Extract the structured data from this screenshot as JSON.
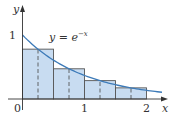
{
  "chart_data": {
    "type": "area",
    "title": "",
    "curve_label": "y = e^(−x)",
    "curve_label_parts": {
      "lhs": "y",
      "eq": " = ",
      "base": "e",
      "exp": "−x"
    },
    "xlabel": "x",
    "ylabel": "y",
    "x_ticks": [
      {
        "value": 0,
        "label": "0"
      },
      {
        "value": 1,
        "label": "1"
      },
      {
        "value": 2,
        "label": "2"
      }
    ],
    "y_ticks": [
      {
        "value": 1,
        "label": "1"
      }
    ],
    "xlim": [
      0,
      2.3
    ],
    "ylim": [
      0,
      1.5
    ],
    "method": "midpoint rule",
    "n": 4,
    "rectangles": [
      {
        "x0": 0.0,
        "x1": 0.5,
        "midpoint": 0.25,
        "height": 0.779
      },
      {
        "x0": 0.5,
        "x1": 1.0,
        "midpoint": 0.75,
        "height": 0.472
      },
      {
        "x0": 1.0,
        "x1": 1.5,
        "midpoint": 1.25,
        "height": 0.287
      },
      {
        "x0": 1.5,
        "x1": 2.0,
        "midpoint": 1.75,
        "height": 0.174
      }
    ],
    "curve": {
      "function": "exp(-x)",
      "x_range": [
        0,
        2.25
      ]
    },
    "colors": {
      "fill": "#c8dcf1",
      "curve": "#3c7ab8",
      "edges": "#555555",
      "axes": "#333333"
    }
  }
}
